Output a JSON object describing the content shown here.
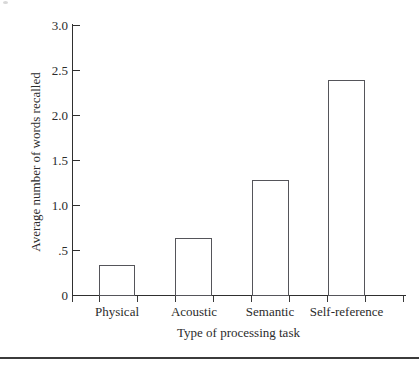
{
  "chart_data": {
    "type": "bar",
    "title": "",
    "categories": [
      "Physical",
      "Acoustic",
      "Semantic",
      "Self-reference"
    ],
    "values": [
      0.34,
      0.64,
      1.28,
      2.39
    ],
    "xlabel": "Type of processing task",
    "ylabel": "Average number of words recalled",
    "ylim": [
      0,
      3.0
    ],
    "ytick_values": [
      0,
      0.5,
      1.0,
      1.5,
      2.0,
      2.5,
      3.0
    ],
    "ytick_labels": [
      "0",
      ".5",
      "1.0",
      "1.5",
      "2.0",
      "2.5",
      "3.0"
    ],
    "grid": false,
    "legend": null,
    "bar_fill_color": "#ffffff",
    "bar_edge_color": "#55555a",
    "axis_color": "#2f2f2f",
    "text_color": "#2b2b2b",
    "background_color": "#ffffff"
  },
  "axes": {
    "y_ticks": [
      {
        "label": "3.0",
        "top": 19
      },
      {
        "label": "2.5",
        "top": 64
      },
      {
        "label": "2.0",
        "top": 109
      },
      {
        "label": "1.5",
        "top": 154
      },
      {
        "label": "1.0",
        "top": 199
      },
      {
        "label": ".5",
        "top": 244
      },
      {
        "label": "0",
        "top": 289
      }
    ],
    "tick_marks": [
      {
        "top": 25
      },
      {
        "top": 70
      },
      {
        "top": 115
      },
      {
        "top": 160
      },
      {
        "top": 205
      },
      {
        "top": 250
      },
      {
        "top": 295
      }
    ],
    "x_tick_positions": [
      72,
      99,
      137,
      175,
      213,
      251,
      289,
      327,
      365,
      403
    ]
  },
  "bars": [
    {
      "name": "Physical",
      "left": 99,
      "width": 36,
      "top": 265,
      "height": 31,
      "value": 0.34
    },
    {
      "name": "Acoustic",
      "left": 175,
      "width": 37,
      "top": 238,
      "height": 58,
      "value": 0.64
    },
    {
      "name": "Semantic",
      "left": 252,
      "width": 37,
      "top": 180,
      "height": 116,
      "value": 1.28
    },
    {
      "name": "Self-reference",
      "left": 328,
      "width": 37,
      "top": 80,
      "height": 216,
      "value": 2.39
    }
  ],
  "category_labels": [
    {
      "label": "Physical",
      "left": 80,
      "width": 74
    },
    {
      "label": "Acoustic",
      "left": 157,
      "width": 74
    },
    {
      "label": "Semantic",
      "left": 233,
      "width": 74
    },
    {
      "label": "Self-reference",
      "left": 300,
      "width": 93
    }
  ]
}
